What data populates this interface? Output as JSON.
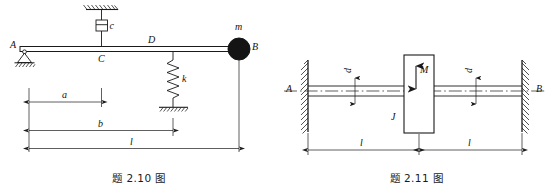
{
  "page": {
    "background": "#ffffff",
    "ink": "#1a1a1a",
    "width": 555,
    "height": 191
  },
  "figures": [
    {
      "id": "fig-2-10",
      "caption": "题 2.10 图",
      "title_text": "题 2.10 图",
      "description": "Cantilever-type beam AB on pin support at A with viscous damper c at C, spring k at D, and lumped mass m at free end B",
      "labels": {
        "point_a": "A",
        "point_b": "B",
        "point_c": "C",
        "point_d": "D",
        "damper": "c",
        "spring": "k",
        "mass": "m",
        "dim_a": "a",
        "dim_b": "b",
        "dim_l": "l"
      },
      "elements": {
        "support_type": "pin-support",
        "damper_type": "dashpot",
        "spring_type": "coil-spring",
        "mass_type": "filled-circle",
        "ground_symbol": "hatched-ground"
      },
      "dimensions": [
        {
          "name": "a",
          "label": "a",
          "from": "A",
          "to": "C"
        },
        {
          "name": "b",
          "label": "b",
          "from": "A",
          "to": "D"
        },
        {
          "name": "l",
          "label": "l",
          "from": "A",
          "to": "B"
        }
      ]
    },
    {
      "id": "fig-2-11",
      "caption": "题 2.11 图",
      "title_text": "题 2.11 图",
      "description": "Shaft of diameter d fixed at both walls A and B with central rotor disk of inertia J loaded by torque M",
      "labels": {
        "point_a": "A",
        "point_b": "B",
        "torque": "M",
        "inertia": "J",
        "diameter_left": "d",
        "diameter_right": "d",
        "dim_l_left": "l",
        "dim_l_right": "l"
      },
      "elements": {
        "wall_left": "hatched-wall",
        "wall_right": "hatched-wall",
        "rotor": "rectangular-disk",
        "shaft": "double-line-shaft",
        "centerline": "dash-dot-centerline",
        "torque_arrow": "double-headed-arrow"
      },
      "dimensions": [
        {
          "name": "l-left",
          "label": "l",
          "from": "A",
          "to": "disk"
        },
        {
          "name": "l-right",
          "label": "l",
          "from": "disk",
          "to": "B"
        }
      ]
    }
  ]
}
